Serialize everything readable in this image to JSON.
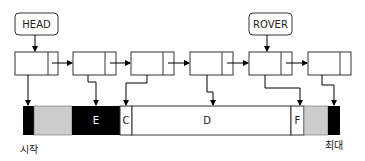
{
  "diagram": {
    "pointers": [
      {
        "label": "HEAD",
        "target_node": 0
      },
      {
        "label": "ROVER",
        "target_node": 4
      }
    ],
    "nodes_count": 6,
    "segments": [
      {
        "label": "",
        "fill": "#000000"
      },
      {
        "label": "",
        "fill": "#cccccc"
      },
      {
        "label": "E",
        "fill": "#000000"
      },
      {
        "label": "C",
        "fill": "#ffffff"
      },
      {
        "label": "D",
        "fill": "#ffffff"
      },
      {
        "label": "F",
        "fill": "#ffffff"
      },
      {
        "label": "",
        "fill": "#cccccc"
      },
      {
        "label": "",
        "fill": "#000000"
      }
    ],
    "start_label": "시작",
    "end_label": "최대"
  }
}
